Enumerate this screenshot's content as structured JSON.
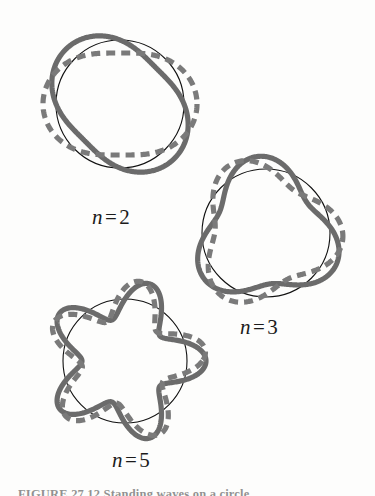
{
  "figure": {
    "caption": "FIGURE 27.12  Standing waves on a circle",
    "background_color": "#fdfdfc",
    "thin_circle_color": "#111111",
    "solid_wave_color": "#6b6b6b",
    "dashed_wave_color": "#7a7a7a",
    "wave_stroke_width": 5.2,
    "circle_stroke_width": 1.1,
    "dash_pattern": "9 6"
  },
  "panels": [
    {
      "id": "n2",
      "label_var": "n",
      "label_eq": "=",
      "label_value": "2",
      "label_text": "n = 2",
      "harmonic": 2,
      "center_x": 120,
      "center_y": 104,
      "radius": 64,
      "amplitude": 13,
      "solid_phase_deg": 0,
      "dashed_phase_deg": 90
    },
    {
      "id": "n3",
      "label_var": "n",
      "label_eq": "=",
      "label_value": "3",
      "label_text": "n = 3",
      "harmonic": 3,
      "center_x": 266,
      "center_y": 233,
      "radius": 64,
      "amplitude": 13,
      "solid_phase_deg": 18,
      "dashed_phase_deg": 78
    },
    {
      "id": "n5",
      "label_var": "n",
      "label_eq": "=",
      "label_value": "5",
      "label_text": "n = 5",
      "harmonic": 5,
      "center_x": 125,
      "center_y": 361,
      "radius": 62,
      "amplitude": 19,
      "solid_phase_deg": 90,
      "dashed_phase_deg": 126
    }
  ]
}
